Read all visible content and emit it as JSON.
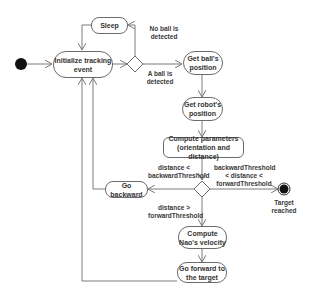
{
  "diagram": {
    "type": "activity-diagram",
    "colors": {
      "line": "#7a7a7a",
      "border": "#6b6b6b",
      "node_fill": "#ffffff",
      "terminal": "#111111",
      "text": "#333333"
    },
    "nodes": {
      "initialize": "Initialize tracking event",
      "sleep": "Sleep",
      "get_ball": "Get ball's position",
      "get_robot": "Get robot's position",
      "compute_params": "Compute parameters (orientation and distance)",
      "go_backward": "Go backward",
      "compute_velocity": "Compute Nao's velocity",
      "go_forward": "Go forward to the target",
      "final_label": "Target reached"
    },
    "guards": {
      "no_ball": "No ball is detected",
      "ball": "A ball is detected",
      "backward": "distance < backwardThreshold",
      "reached": "backwardThreshold < distance < forwardThreshold",
      "forward": "distance > forwardThreshold"
    }
  }
}
